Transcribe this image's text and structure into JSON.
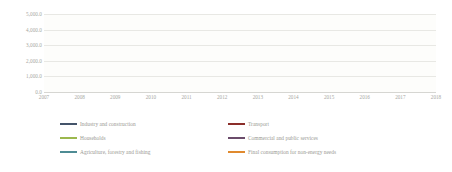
{
  "chart_data": {
    "type": "line",
    "title": "",
    "xlabel": "",
    "ylabel": "",
    "grid": true,
    "legend_position": "bottom",
    "categories": [
      "2007",
      "2008",
      "2009",
      "2010",
      "2011",
      "2012",
      "2013",
      "2014",
      "2015",
      "2016",
      "2017",
      "2018"
    ],
    "x": [
      2007,
      2008,
      2009,
      2010,
      2011,
      2012,
      2013,
      2014,
      2015,
      2016,
      2017,
      2018
    ],
    "ylim": [
      0,
      5000
    ],
    "yticks": [
      0,
      1000,
      2000,
      3000,
      4000,
      5000
    ],
    "ytick_labels": [
      "0.0",
      "1,000.0",
      "2,000.0",
      "3,000.0",
      "4,000.0",
      "5,000.0"
    ],
    "series": [
      {
        "name": "Industry and construction",
        "color": "#44546A",
        "values": [
          1280,
          1420,
          1050,
          1020,
          1120,
          1330,
          1400,
          1430,
          1440,
          1620,
          1230,
          1150
        ]
      },
      {
        "name": "Transport",
        "color": "#8B2E2A",
        "values": [
          1300,
          1500,
          1560,
          1540,
          1760,
          1960,
          2140,
          2210,
          2280,
          2150,
          2440,
          2520
        ]
      },
      {
        "name": "Households",
        "color": "#9CB84E",
        "values": [
          3180,
          3480,
          3330,
          3210,
          3160,
          3180,
          3310,
          3190,
          3110,
          3570,
          3360,
          3570
        ]
      },
      {
        "name": "Commercial and public services",
        "color": "#6B4C6B",
        "values": [
          820,
          900,
          860,
          840,
          860,
          880,
          900,
          890,
          880,
          900,
          890,
          900
        ]
      },
      {
        "name": "Agriculture, forestry and fishing",
        "color": "#4E8C94",
        "values": [
          760,
          790,
          770,
          760,
          770,
          780,
          790,
          790,
          780,
          790,
          800,
          810
        ]
      },
      {
        "name": "Final consumption for non-energy needs",
        "color": "#E08A2E",
        "values": [
          830,
          870,
          840,
          830,
          840,
          860,
          870,
          880,
          880,
          1000,
          1230,
          1250
        ]
      }
    ]
  },
  "legend": {
    "items": [
      {
        "label": "Industry and construction",
        "color": "#44546A",
        "col": 0,
        "row": 0
      },
      {
        "label": "Transport",
        "color": "#8B2E2A",
        "col": 1,
        "row": 0
      },
      {
        "label": "Households",
        "color": "#9CB84E",
        "col": 0,
        "row": 1
      },
      {
        "label": "Commercial and public services",
        "color": "#6B4C6B",
        "col": 1,
        "row": 1
      },
      {
        "label": "Agriculture, forestry and fishing",
        "color": "#4E8C94",
        "col": 0,
        "row": 2
      },
      {
        "label": "Final consumption for non-energy needs",
        "color": "#E08A2E",
        "col": 1,
        "row": 2
      }
    ]
  }
}
